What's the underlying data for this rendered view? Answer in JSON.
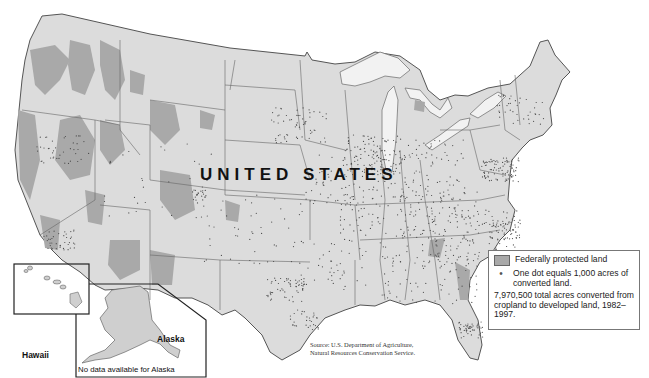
{
  "map": {
    "country_label": "UNITED STATES",
    "colors": {
      "land": "#dcdcdc",
      "protected_land": "#a9a9a9",
      "borders": "#555555",
      "lakes": "#f2f2f2",
      "dots": "#4a4a4a"
    },
    "insets": {
      "hawaii_label": "Hawaii",
      "alaska_label": "Alaska",
      "alaska_note": "No data available for Alaska"
    }
  },
  "legend": {
    "protected_label": "Federally protected land",
    "dot_label": "One dot equals 1,000 acres of converted land.",
    "total_note": "7,970,500 total acres converted from cropland to developed land, 1982–1997."
  },
  "source": {
    "line1": "Source: U.S. Department of Agriculture,",
    "line2": "Natural Resources Conservation Service."
  }
}
